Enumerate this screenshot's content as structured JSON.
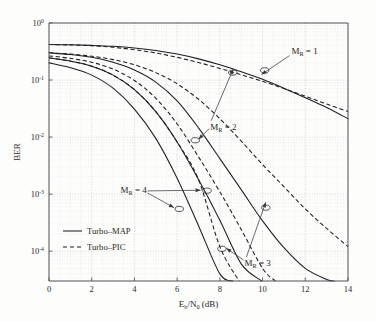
{
  "chart_data": {
    "type": "line",
    "title": "",
    "xlabel": "E_b/N_0 (dB)",
    "xlabel_main": "E",
    "xlabel_sub1": "b",
    "xlabel_mid": "/N",
    "xlabel_sub2": "0",
    "xlabel_tail": " (dB)",
    "ylabel": "BER",
    "xlim": [
      0,
      14
    ],
    "ylim": [
      3e-05,
      1
    ],
    "yscale": "log",
    "xscale": "linear",
    "grid": true,
    "grid_style": "dotted-minor-and-major",
    "xticks": [
      0,
      2,
      4,
      6,
      8,
      10,
      12,
      14
    ],
    "xticklabels": [
      "0",
      "2",
      "4",
      "6",
      "8",
      "10",
      "12",
      "14"
    ],
    "yticks": [
      1,
      0.1,
      0.01,
      0.001,
      0.0001
    ],
    "yticklabels": [
      "10^0",
      "10^-1",
      "10^-2",
      "10^-3",
      "10^-4"
    ],
    "ytick_mantissa": "10",
    "ytick_exponents": [
      "0",
      "-1",
      "-2",
      "-3",
      "-4"
    ],
    "legend_position": "lower-left-inside",
    "legend": [
      {
        "label": "Turbo–MAP",
        "style": "solid"
      },
      {
        "label": "Turbo–PIC",
        "style": "dashed"
      }
    ],
    "series": [
      {
        "name": "Turbo-MAP, M_R = 1",
        "style": "solid",
        "group": "M_R = 1",
        "x": [
          0,
          1,
          2,
          3,
          4,
          5,
          6,
          7,
          8,
          9,
          10,
          11,
          12,
          13,
          14
        ],
        "y": [
          0.42,
          0.415,
          0.405,
          0.39,
          0.365,
          0.33,
          0.285,
          0.235,
          0.185,
          0.14,
          0.103,
          0.072,
          0.049,
          0.033,
          0.021
        ]
      },
      {
        "name": "Turbo-PIC, M_R = 1",
        "style": "dashed",
        "group": "M_R = 1",
        "x": [
          0,
          1,
          2,
          3,
          4,
          5,
          6,
          7,
          8,
          9,
          10,
          11,
          12,
          13,
          14
        ],
        "y": [
          0.42,
          0.412,
          0.398,
          0.375,
          0.34,
          0.298,
          0.25,
          0.203,
          0.16,
          0.124,
          0.095,
          0.071,
          0.052,
          0.038,
          0.028
        ]
      },
      {
        "name": "Turbo-MAP, M_R = 2",
        "style": "solid",
        "group": "M_R = 2",
        "x": [
          0,
          1,
          2,
          3,
          4,
          5,
          6,
          7,
          8,
          9,
          10,
          11,
          12,
          13,
          13.35
        ],
        "y": [
          0.3,
          0.28,
          0.25,
          0.205,
          0.15,
          0.092,
          0.043,
          0.0145,
          0.0042,
          0.0012,
          0.00034,
          0.000115,
          5e-05,
          3.2e-05,
          3e-05
        ]
      },
      {
        "name": "Turbo-PIC, M_R = 2",
        "style": "dashed",
        "group": "M_R = 2",
        "x": [
          0,
          1,
          2,
          3,
          4,
          5,
          6,
          7,
          8,
          9,
          10,
          11,
          12,
          13,
          14
        ],
        "y": [
          0.3,
          0.285,
          0.262,
          0.228,
          0.185,
          0.135,
          0.086,
          0.046,
          0.021,
          0.0085,
          0.0033,
          0.00135,
          0.00055,
          0.00025,
          0.00012
        ]
      },
      {
        "name": "Turbo-MAP, M_R = 3",
        "style": "solid",
        "group": "M_R = 3",
        "x": [
          0,
          1,
          2,
          3,
          4,
          5,
          6,
          7,
          8,
          9,
          9.95
        ],
        "y": [
          0.245,
          0.215,
          0.175,
          0.122,
          0.068,
          0.028,
          0.0082,
          0.0018,
          0.00035,
          6e-05,
          3e-05
        ]
      },
      {
        "name": "Turbo-PIC, M_R = 3",
        "style": "dashed",
        "group": "M_R = 3",
        "x": [
          0,
          1,
          2,
          3,
          4,
          5,
          6,
          7,
          8,
          9,
          10,
          10.6
        ],
        "y": [
          0.265,
          0.24,
          0.205,
          0.155,
          0.098,
          0.048,
          0.017,
          0.0045,
          0.0011,
          0.00024,
          5e-05,
          3e-05
        ]
      },
      {
        "name": "Turbo-MAP, M_R = 4",
        "style": "solid",
        "group": "M_R = 4",
        "x": [
          0,
          1,
          2,
          3,
          4,
          5,
          6,
          7,
          8,
          8.6
        ],
        "y": [
          0.2,
          0.165,
          0.122,
          0.072,
          0.031,
          0.0095,
          0.0019,
          0.00028,
          4e-05,
          3e-05
        ]
      },
      {
        "name": "Turbo-PIC, M_R = 4",
        "style": "dashed",
        "group": "M_R = 4",
        "x": [
          0,
          1,
          2,
          3,
          4,
          5,
          6,
          7,
          8,
          8.9
        ],
        "y": [
          0.245,
          0.215,
          0.175,
          0.122,
          0.068,
          0.028,
          0.0082,
          0.0018,
          0.00012,
          3e-05
        ]
      }
    ],
    "annotations": [
      {
        "label": "M_R = 1",
        "label_main": "M",
        "label_sub": "R",
        "label_tail": " = 1",
        "text_x": 11.35,
        "text_y": 0.29
      },
      {
        "label": "M_R = 2",
        "label_main": "M",
        "label_sub": "R",
        "label_tail": " = 2",
        "text_x": 7.55,
        "text_y": 0.0135
      },
      {
        "label": "M_R = 3",
        "label_main": "M",
        "label_sub": "R",
        "label_tail": " = 3",
        "text_x": 9.15,
        "text_y": 5.5e-05
      },
      {
        "label": "M_R = 4",
        "label_main": "M",
        "label_sub": "R",
        "label_tail": " = 4",
        "text_x": 3.35,
        "text_y": 0.00105
      }
    ],
    "markers": [
      {
        "x": 10.1,
        "y": 0.148,
        "group": "M_R = 1"
      },
      {
        "x": 8.6,
        "y": 0.135,
        "group": "M_R = 2"
      },
      {
        "x": 6.85,
        "y": 0.0088,
        "group": "M_R = 2"
      },
      {
        "x": 7.4,
        "y": 0.00115,
        "group": "M_R = 4"
      },
      {
        "x": 6.1,
        "y": 0.00055,
        "group": "M_R = 4"
      },
      {
        "x": 10.15,
        "y": 0.00058,
        "group": "M_R = 3"
      },
      {
        "x": 8.1,
        "y": 0.00011,
        "group": "M_R = 3"
      }
    ]
  }
}
